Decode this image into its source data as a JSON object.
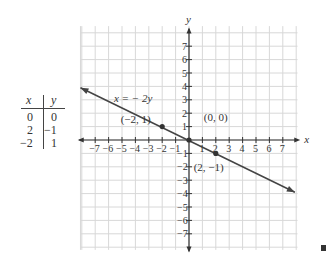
{
  "table": {
    "headers": [
      "x",
      "y"
    ],
    "rows": [
      [
        "0",
        "0"
      ],
      [
        "2",
        "−1"
      ],
      [
        "−2",
        "1"
      ]
    ]
  },
  "chart_data": {
    "type": "line",
    "title": "",
    "equation_label": "x = − 2y",
    "xlabel": "x",
    "ylabel": "y",
    "xlim": [
      -8,
      8
    ],
    "ylim": [
      -8,
      8
    ],
    "grid": true,
    "x_ticks": [
      "−7",
      "−6",
      "−5",
      "−4",
      "−3",
      "−2",
      "−1",
      "1",
      "2",
      "3",
      "4",
      "5",
      "6",
      "7"
    ],
    "y_ticks": [
      "7",
      "6",
      "5",
      "4",
      "3",
      "2",
      "1",
      "−1",
      "−2",
      "−3",
      "−4",
      "−5",
      "−6",
      "−7"
    ],
    "series": [
      {
        "name": "x = -2y",
        "x": [
          -8.1,
          7.9
        ],
        "y": [
          3.9,
          -3.9
        ]
      }
    ],
    "points": [
      {
        "x": -2,
        "y": 1,
        "label": "(−2, 1)"
      },
      {
        "x": 0,
        "y": 0,
        "label": "(0, 0)"
      },
      {
        "x": 2,
        "y": -1,
        "label": "(2, −1)"
      }
    ]
  }
}
